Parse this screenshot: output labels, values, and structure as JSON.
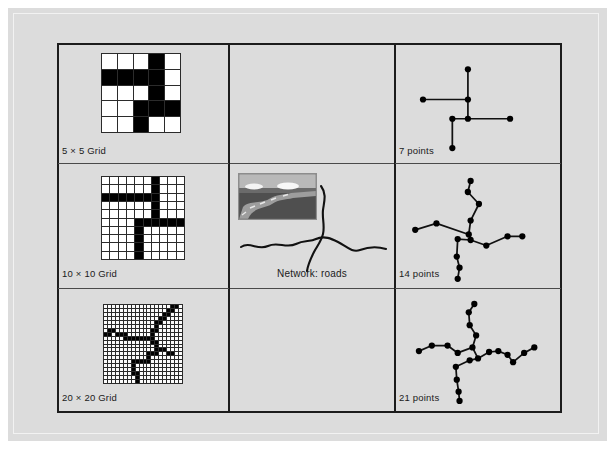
{
  "figure": {
    "background_color": "#dcdcdc",
    "frame_color": "#1c1c1c"
  },
  "panels": [
    {
      "id": "grids",
      "name": "grid-panel",
      "cells": [
        {
          "label": "5 × 5 Grid",
          "type": "grid",
          "size": 5
        },
        {
          "label": "10 × 10 Grid",
          "type": "grid",
          "size": 10
        },
        {
          "label": "20 × 20 Grid",
          "type": "grid",
          "size": 20
        }
      ]
    },
    {
      "id": "network",
      "name": "network-panel",
      "cells": [
        {
          "label": "",
          "type": "empty"
        },
        {
          "label": "Network: roads",
          "type": "photo-sketch"
        },
        {
          "label": "",
          "type": "empty"
        }
      ]
    },
    {
      "id": "points",
      "name": "points-panel",
      "cells": [
        {
          "label": "7 points",
          "type": "point-network",
          "count": 7
        },
        {
          "label": "14 points",
          "type": "point-network",
          "count": 14
        },
        {
          "label": "21 points",
          "type": "point-network",
          "count": 21
        }
      ]
    }
  ],
  "labels": {
    "grid5": "5 × 5 Grid",
    "grid10": "10 × 10 Grid",
    "grid20": "20 × 20 Grid",
    "network_roads": "Network: roads",
    "points7": "7 points",
    "points14": "14 points",
    "points21": "21 points"
  },
  "chart_data": {
    "type": "diagram",
    "title": "",
    "grid5": {
      "rows": 5,
      "cols": 5,
      "filled": [
        [
          0,
          0,
          0,
          1,
          0
        ],
        [
          1,
          1,
          1,
          1,
          0
        ],
        [
          0,
          0,
          0,
          1,
          0
        ],
        [
          0,
          0,
          1,
          1,
          1
        ],
        [
          0,
          0,
          1,
          0,
          0
        ]
      ]
    },
    "grid10": {
      "rows": 10,
      "cols": 10,
      "filled": [
        [
          0,
          0,
          0,
          0,
          0,
          0,
          1,
          0,
          0,
          0
        ],
        [
          0,
          0,
          0,
          0,
          0,
          0,
          1,
          0,
          0,
          0
        ],
        [
          1,
          1,
          1,
          1,
          1,
          1,
          1,
          0,
          0,
          0
        ],
        [
          0,
          0,
          0,
          0,
          0,
          0,
          1,
          0,
          0,
          0
        ],
        [
          0,
          0,
          0,
          0,
          0,
          0,
          1,
          0,
          0,
          0
        ],
        [
          0,
          0,
          0,
          0,
          1,
          1,
          1,
          1,
          1,
          1
        ],
        [
          0,
          0,
          0,
          0,
          1,
          0,
          0,
          0,
          0,
          0
        ],
        [
          0,
          0,
          0,
          0,
          1,
          0,
          0,
          0,
          0,
          0
        ],
        [
          0,
          0,
          0,
          0,
          1,
          0,
          0,
          0,
          0,
          0
        ],
        [
          0,
          0,
          0,
          0,
          1,
          0,
          0,
          0,
          0,
          0
        ]
      ]
    },
    "grid20": {
      "rows": 20,
      "cols": 20,
      "filled": [
        [
          0,
          0,
          0,
          0,
          0,
          0,
          0,
          0,
          0,
          0,
          0,
          0,
          0,
          0,
          0,
          0,
          0,
          1,
          1,
          0
        ],
        [
          0,
          0,
          0,
          0,
          0,
          0,
          0,
          0,
          0,
          0,
          0,
          0,
          0,
          0,
          0,
          0,
          1,
          1,
          0,
          0
        ],
        [
          0,
          0,
          0,
          0,
          0,
          0,
          0,
          0,
          0,
          0,
          0,
          0,
          0,
          0,
          0,
          1,
          1,
          0,
          0,
          0
        ],
        [
          0,
          0,
          0,
          0,
          0,
          0,
          0,
          0,
          0,
          0,
          0,
          0,
          0,
          0,
          1,
          1,
          0,
          0,
          0,
          0
        ],
        [
          0,
          0,
          0,
          0,
          0,
          0,
          0,
          0,
          0,
          0,
          0,
          0,
          0,
          1,
          1,
          0,
          0,
          0,
          0,
          0
        ],
        [
          0,
          0,
          0,
          0,
          0,
          0,
          0,
          0,
          0,
          0,
          0,
          0,
          0,
          1,
          0,
          0,
          0,
          0,
          0,
          0
        ],
        [
          0,
          1,
          1,
          0,
          0,
          0,
          0,
          0,
          0,
          0,
          0,
          0,
          1,
          1,
          0,
          0,
          0,
          0,
          0,
          0
        ],
        [
          1,
          1,
          0,
          1,
          1,
          1,
          0,
          0,
          0,
          0,
          0,
          0,
          1,
          0,
          0,
          0,
          0,
          0,
          0,
          0
        ],
        [
          0,
          0,
          0,
          0,
          0,
          1,
          1,
          1,
          1,
          1,
          1,
          1,
          1,
          0,
          0,
          0,
          0,
          0,
          0,
          0
        ],
        [
          0,
          0,
          0,
          0,
          0,
          0,
          0,
          0,
          0,
          0,
          0,
          0,
          1,
          1,
          0,
          0,
          0,
          0,
          0,
          0
        ],
        [
          0,
          0,
          0,
          0,
          0,
          0,
          0,
          0,
          0,
          0,
          0,
          0,
          0,
          1,
          0,
          0,
          0,
          0,
          0,
          0
        ],
        [
          0,
          0,
          0,
          0,
          0,
          0,
          0,
          0,
          0,
          0,
          0,
          0,
          0,
          1,
          1,
          1,
          0,
          0,
          0,
          0
        ],
        [
          0,
          0,
          0,
          0,
          0,
          0,
          0,
          0,
          0,
          0,
          0,
          1,
          1,
          1,
          0,
          0,
          1,
          1,
          0,
          0
        ],
        [
          0,
          0,
          0,
          0,
          0,
          0,
          0,
          0,
          0,
          0,
          0,
          1,
          0,
          0,
          0,
          0,
          0,
          0,
          0,
          0
        ],
        [
          0,
          0,
          0,
          0,
          0,
          0,
          0,
          1,
          1,
          1,
          1,
          1,
          0,
          0,
          0,
          0,
          0,
          0,
          0,
          0
        ],
        [
          0,
          0,
          0,
          0,
          0,
          0,
          0,
          1,
          0,
          0,
          0,
          0,
          0,
          0,
          0,
          0,
          0,
          0,
          0,
          0
        ],
        [
          0,
          0,
          0,
          0,
          0,
          0,
          0,
          1,
          0,
          0,
          0,
          0,
          0,
          0,
          0,
          0,
          0,
          0,
          0,
          0
        ],
        [
          0,
          0,
          0,
          0,
          0,
          0,
          0,
          1,
          1,
          0,
          0,
          0,
          0,
          0,
          0,
          0,
          0,
          0,
          0,
          0
        ],
        [
          0,
          0,
          0,
          0,
          0,
          0,
          0,
          0,
          1,
          0,
          0,
          0,
          0,
          0,
          0,
          0,
          0,
          0,
          0,
          0
        ],
        [
          0,
          0,
          0,
          0,
          0,
          0,
          0,
          0,
          1,
          0,
          0,
          0,
          0,
          0,
          0,
          0,
          0,
          0,
          0,
          0
        ]
      ]
    },
    "points7": {
      "count": 7,
      "nodes": [
        [
          69,
          21
        ],
        [
          69,
          54
        ],
        [
          20,
          54
        ],
        [
          69,
          75
        ],
        [
          52,
          75
        ],
        [
          115,
          75
        ],
        [
          52,
          107
        ]
      ],
      "edges": [
        [
          0,
          1
        ],
        [
          1,
          2
        ],
        [
          1,
          3
        ],
        [
          3,
          4
        ],
        [
          3,
          5
        ],
        [
          4,
          6
        ]
      ]
    },
    "points14": {
      "count": 14,
      "nodes": [
        [
          72,
          14
        ],
        [
          69,
          26
        ],
        [
          81,
          39
        ],
        [
          72,
          57
        ],
        [
          70,
          72
        ],
        [
          35,
          60
        ],
        [
          12,
          67
        ],
        [
          58,
          77
        ],
        [
          72,
          78
        ],
        [
          89,
          84
        ],
        [
          112,
          74
        ],
        [
          128,
          74
        ],
        [
          57,
          96
        ],
        [
          60,
          108
        ],
        [
          58,
          120
        ]
      ],
      "edges": [
        [
          0,
          1
        ],
        [
          1,
          2
        ],
        [
          2,
          3
        ],
        [
          3,
          4
        ],
        [
          4,
          5
        ],
        [
          5,
          6
        ],
        [
          4,
          8
        ],
        [
          7,
          8
        ],
        [
          8,
          9
        ],
        [
          9,
          10
        ],
        [
          10,
          11
        ],
        [
          7,
          12
        ],
        [
          12,
          13
        ],
        [
          13,
          14
        ]
      ]
    },
    "points21": {
      "count": 21,
      "nodes": [
        [
          76,
          13
        ],
        [
          70,
          22
        ],
        [
          71,
          36
        ],
        [
          78,
          47
        ],
        [
          74,
          60
        ],
        [
          58,
          66
        ],
        [
          30,
          58
        ],
        [
          16,
          64
        ],
        [
          47,
          58
        ],
        [
          80,
          72
        ],
        [
          92,
          65
        ],
        [
          102,
          64
        ],
        [
          112,
          68
        ],
        [
          118,
          76
        ],
        [
          130,
          66
        ],
        [
          141,
          60
        ],
        [
          71,
          74
        ],
        [
          56,
          81
        ],
        [
          57,
          95
        ],
        [
          59,
          108
        ],
        [
          60,
          118
        ]
      ],
      "edges": [
        [
          0,
          1
        ],
        [
          1,
          2
        ],
        [
          2,
          3
        ],
        [
          3,
          4
        ],
        [
          4,
          5
        ],
        [
          5,
          8
        ],
        [
          8,
          6
        ],
        [
          6,
          7
        ],
        [
          4,
          9
        ],
        [
          9,
          10
        ],
        [
          10,
          11
        ],
        [
          11,
          12
        ],
        [
          12,
          13
        ],
        [
          13,
          14
        ],
        [
          14,
          15
        ],
        [
          9,
          16
        ],
        [
          16,
          17
        ],
        [
          17,
          18
        ],
        [
          18,
          19
        ],
        [
          19,
          20
        ]
      ]
    },
    "roads_sketch": {
      "description": "Hand-drawn curvy road lines: a long horizontal sinuous line crossed by a vertical sinuous line",
      "photo": {
        "sky_color": "#b9b9b9",
        "ground_color": "#555555",
        "road_color": "#a8a8a8",
        "cloud_color": "#f2f2f2"
      }
    }
  }
}
